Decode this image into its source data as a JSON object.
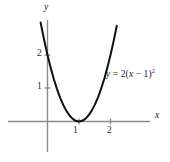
{
  "figure": {
    "background_color": "#ffffff",
    "axis_color": "#8a8a8a",
    "curve_color": "#101010"
  },
  "axes": {
    "x_axis_label": "x",
    "y_axis_label": "y",
    "x_ticks": [
      "1",
      "2"
    ],
    "y_ticks": [
      "1",
      "2"
    ]
  },
  "annotations": {
    "equation": {
      "lhs": "y",
      "equals": " = ",
      "coefficient": "2(",
      "variable": "x",
      "minus": " − 1)",
      "exponent": "2",
      "full": "y = 2(x − 1)²"
    }
  },
  "chart_data": {
    "type": "line",
    "title": "",
    "subtitle": "",
    "xlabel": "x",
    "ylabel": "y",
    "xlim": [
      -1.15,
      3.0
    ],
    "ylim": [
      -0.9,
      2.95
    ],
    "grid": false,
    "legend": null,
    "xticks": [
      1,
      2
    ],
    "xticklabels": [
      "1",
      "2"
    ],
    "yticks": [
      1,
      2
    ],
    "yticklabels": [
      "1",
      "2"
    ],
    "series": [
      {
        "name": "y = 2(x - 1)^2",
        "equation": "y = 2(x - 1)^2",
        "color": "#101010",
        "vertex": [
          1,
          0
        ],
        "y_intercept": 2,
        "x": [
          -0.22,
          -0.1,
          0.0,
          0.1,
          0.2,
          0.3,
          0.4,
          0.5,
          0.6,
          0.7,
          0.8,
          0.9,
          1.0,
          1.1,
          1.2,
          1.3,
          1.4,
          1.5,
          1.6,
          1.7,
          1.8,
          1.9,
          2.0,
          2.1,
          2.2
        ],
        "values": [
          2.98,
          2.42,
          2.0,
          1.62,
          1.28,
          0.98,
          0.72,
          0.5,
          0.32,
          0.18,
          0.08,
          0.02,
          0.0,
          0.02,
          0.08,
          0.18,
          0.32,
          0.5,
          0.72,
          0.98,
          1.28,
          1.62,
          2.0,
          2.42,
          2.88
        ]
      }
    ],
    "annotations": [
      {
        "text": "y = 2(x − 1)²",
        "x": 2.1,
        "y": 1.4
      }
    ]
  }
}
